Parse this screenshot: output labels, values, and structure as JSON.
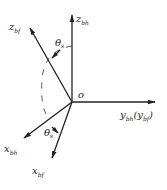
{
  "diagram": {
    "origin_label": "o",
    "axes": {
      "z_bh": {
        "main": "z",
        "sub": "bh"
      },
      "z_bf": {
        "main": "z",
        "sub": "bf"
      },
      "y": {
        "main": "y",
        "sub": "bh",
        "paren_main": "y",
        "paren_sub": "bf"
      },
      "x_bh": {
        "main": "x",
        "sub": "bh"
      },
      "x_bf": {
        "main": "x",
        "sub": "bf"
      }
    },
    "angles": {
      "top": {
        "main": "θ",
        "sub": "s"
      },
      "bottom": {
        "main": "θ",
        "sub": "s"
      }
    },
    "colors": {
      "line": "#222222",
      "background": "#ffffff"
    }
  }
}
